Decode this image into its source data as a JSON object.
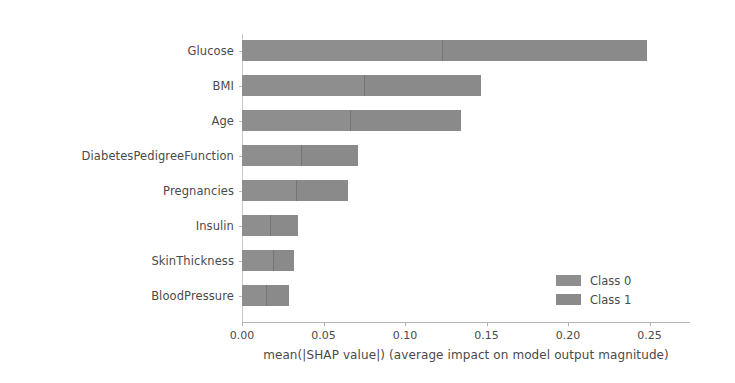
{
  "chart_data": {
    "type": "bar",
    "orientation": "horizontal",
    "stacked": true,
    "title": "",
    "xlabel": "mean(|SHAP value|) (average impact on model output magnitude)",
    "ylabel": "",
    "xlim": [
      0.0,
      0.275
    ],
    "grid": false,
    "categories": [
      "Glucose",
      "BMI",
      "Age",
      "DiabetesPedigreeFunction",
      "Pregnancies",
      "Insulin",
      "SkinThickness",
      "BloodPressure"
    ],
    "xticks": [
      0.0,
      0.05,
      0.1,
      0.15,
      0.2,
      0.25
    ],
    "xtick_labels": [
      "0.00",
      "0.05",
      "0.10",
      "0.15",
      "0.20",
      "0.25"
    ],
    "series": [
      {
        "name": "Class 0",
        "color": "#8e8e8e",
        "values": [
          0.123,
          0.075,
          0.066,
          0.036,
          0.033,
          0.017,
          0.019,
          0.015
        ]
      },
      {
        "name": "Class 1",
        "color": "#8a8a8a",
        "values": [
          0.126,
          0.072,
          0.068,
          0.035,
          0.032,
          0.017,
          0.013,
          0.014
        ]
      }
    ],
    "totals": [
      0.249,
      0.147,
      0.134,
      0.071,
      0.065,
      0.034,
      0.032,
      0.029
    ],
    "legend": {
      "position": "lower-right",
      "entries": [
        "Class 0",
        "Class 1"
      ]
    }
  },
  "axis": {
    "spine_color": "#bdbdbd",
    "tick_color": "#b0b0b0",
    "text_color": "#4a4a4a"
  }
}
